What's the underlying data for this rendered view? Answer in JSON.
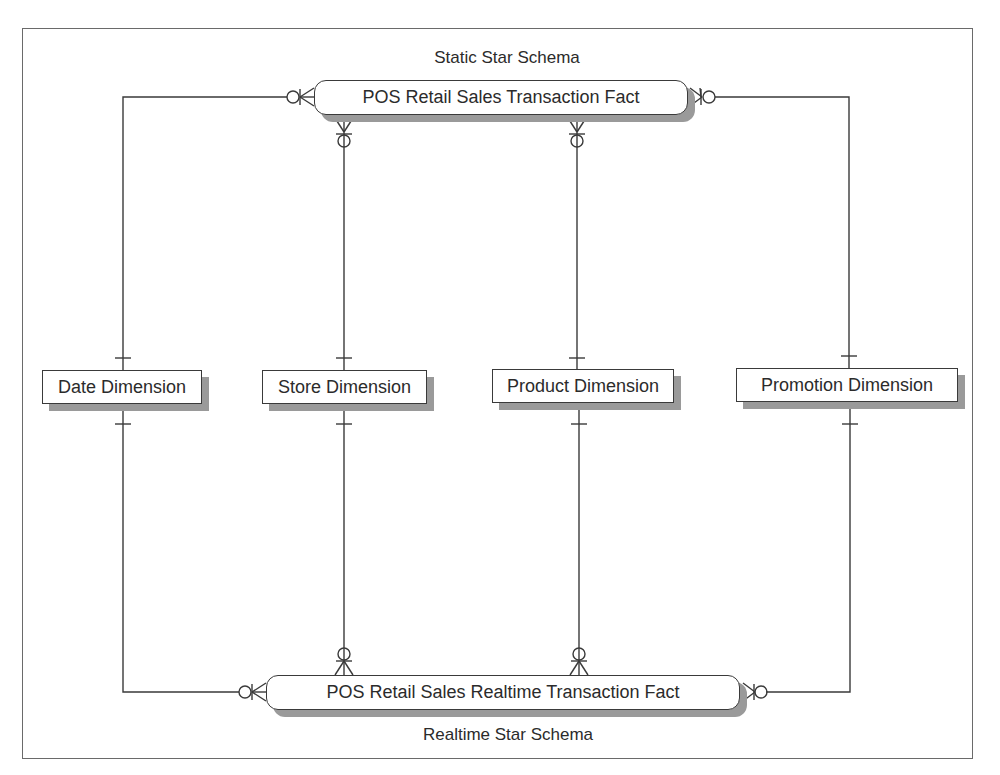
{
  "diagram": {
    "type": "er-diagram",
    "notation": "crows-foot",
    "captions": {
      "top": "Static Star Schema",
      "bottom": "Realtime Star Schema"
    },
    "entities": {
      "static_fact": {
        "label": "POS Retail Sales Transaction Fact",
        "kind": "fact"
      },
      "realtime_fact": {
        "label": "POS Retail Sales Realtime Transaction Fact",
        "kind": "fact"
      },
      "date_dim": {
        "label": "Date Dimension",
        "kind": "dimension"
      },
      "store_dim": {
        "label": "Store Dimension",
        "kind": "dimension"
      },
      "product_dim": {
        "label": "Product Dimension",
        "kind": "dimension"
      },
      "promotion_dim": {
        "label": "Promotion Dimension",
        "kind": "dimension"
      }
    },
    "relationships": [
      {
        "from": "date_dim",
        "to": "static_fact",
        "from_card": "one",
        "to_card": "zero-or-many"
      },
      {
        "from": "store_dim",
        "to": "static_fact",
        "from_card": "one",
        "to_card": "zero-or-many"
      },
      {
        "from": "product_dim",
        "to": "static_fact",
        "from_card": "one",
        "to_card": "zero-or-many"
      },
      {
        "from": "promotion_dim",
        "to": "static_fact",
        "from_card": "one",
        "to_card": "zero-or-many"
      },
      {
        "from": "date_dim",
        "to": "realtime_fact",
        "from_card": "one",
        "to_card": "zero-or-many"
      },
      {
        "from": "store_dim",
        "to": "realtime_fact",
        "from_card": "one",
        "to_card": "zero-or-many"
      },
      {
        "from": "product_dim",
        "to": "realtime_fact",
        "from_card": "one",
        "to_card": "zero-or-many"
      },
      {
        "from": "promotion_dim",
        "to": "realtime_fact",
        "from_card": "one",
        "to_card": "zero-or-many"
      }
    ],
    "colors": {
      "line": "#3a3a3a",
      "shadow": "#9a9a9a",
      "frame": "#6a6a6a",
      "text": "#2b2b2b"
    }
  }
}
